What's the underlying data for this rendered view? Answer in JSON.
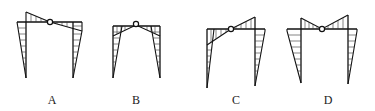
{
  "figure": {
    "options": [
      {
        "label": "A",
        "label_x": 52
      },
      {
        "label": "B",
        "label_x": 136
      },
      {
        "label": "C",
        "label_x": 236
      },
      {
        "label": "D",
        "label_x": 328
      }
    ],
    "label_y": 94,
    "colors": {
      "line": "#111111",
      "background": "#ffffff"
    }
  }
}
